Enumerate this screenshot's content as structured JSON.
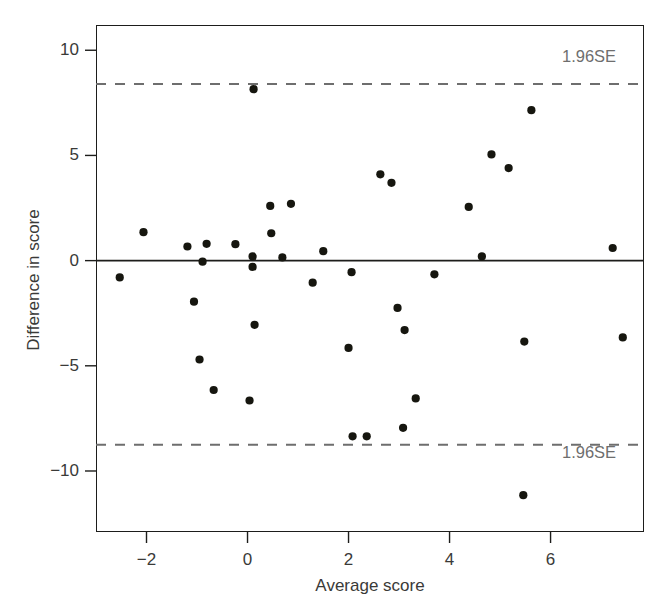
{
  "figure": {
    "background_color": "#ffffff",
    "frame_color": "#1d1d1b",
    "point_color": "#16160f",
    "limit_line_color": "#6e6e6e",
    "zero_line_color": "#1d1d1b"
  },
  "axes": {
    "x_title": "Average score",
    "y_title": "Difference in score",
    "x_ticks": [
      "−2",
      "0",
      "2",
      "4",
      "6"
    ],
    "y_ticks": [
      "10",
      "5",
      "0",
      "−5",
      "−10"
    ]
  },
  "annotations": {
    "upper_limit_label": "1.96SE",
    "lower_limit_label": "1.96SE"
  },
  "chart_data": {
    "type": "scatter",
    "title": "",
    "xlabel": "Average score",
    "ylabel": "Difference in score",
    "xlim": [
      -3.0,
      7.85
    ],
    "ylim": [
      -12.9,
      11.2
    ],
    "xticks": [
      -2,
      0,
      2,
      4,
      6
    ],
    "yticks": [
      10,
      5,
      0,
      -5,
      -10
    ],
    "grid": false,
    "legend": null,
    "reference_lines": [
      {
        "name": "mean-difference",
        "y": 0,
        "style": "solid",
        "label": ""
      },
      {
        "name": "upper-limit-of-agreement",
        "y": 8.4,
        "style": "dashed",
        "label": "1.96SE"
      },
      {
        "name": "lower-limit-of-agreement",
        "y": -8.75,
        "style": "dashed",
        "label": "1.96SE"
      }
    ],
    "points": [
      {
        "x": -2.53,
        "y": -0.8
      },
      {
        "x": -2.06,
        "y": 1.35
      },
      {
        "x": -1.19,
        "y": 0.67
      },
      {
        "x": -1.06,
        "y": -1.95
      },
      {
        "x": -0.95,
        "y": -4.7
      },
      {
        "x": -0.89,
        "y": -0.05
      },
      {
        "x": -0.81,
        "y": 0.8
      },
      {
        "x": -0.67,
        "y": -6.15
      },
      {
        "x": -0.24,
        "y": 0.78
      },
      {
        "x": 0.04,
        "y": -6.65
      },
      {
        "x": 0.1,
        "y": 0.2
      },
      {
        "x": 0.1,
        "y": -0.3
      },
      {
        "x": 0.12,
        "y": 8.15
      },
      {
        "x": 0.14,
        "y": -3.05
      },
      {
        "x": 0.45,
        "y": 2.6
      },
      {
        "x": 0.47,
        "y": 1.3
      },
      {
        "x": 0.69,
        "y": 0.15
      },
      {
        "x": 0.86,
        "y": 2.7
      },
      {
        "x": 1.29,
        "y": -1.05
      },
      {
        "x": 1.5,
        "y": 0.45
      },
      {
        "x": 2.0,
        "y": -4.15
      },
      {
        "x": 2.06,
        "y": -0.55
      },
      {
        "x": 2.08,
        "y": -8.35
      },
      {
        "x": 2.36,
        "y": -8.35
      },
      {
        "x": 2.63,
        "y": 4.1
      },
      {
        "x": 2.85,
        "y": 3.7
      },
      {
        "x": 2.97,
        "y": -2.25
      },
      {
        "x": 3.11,
        "y": -3.3
      },
      {
        "x": 3.08,
        "y": -7.95
      },
      {
        "x": 3.33,
        "y": -6.55
      },
      {
        "x": 3.7,
        "y": -0.65
      },
      {
        "x": 4.38,
        "y": 2.55
      },
      {
        "x": 4.64,
        "y": 0.2
      },
      {
        "x": 4.83,
        "y": 5.05
      },
      {
        "x": 5.17,
        "y": 4.4
      },
      {
        "x": 5.48,
        "y": -3.85
      },
      {
        "x": 5.46,
        "y": -11.15
      },
      {
        "x": 5.62,
        "y": 7.15
      },
      {
        "x": 7.23,
        "y": 0.6
      },
      {
        "x": 7.43,
        "y": -3.65
      }
    ]
  }
}
